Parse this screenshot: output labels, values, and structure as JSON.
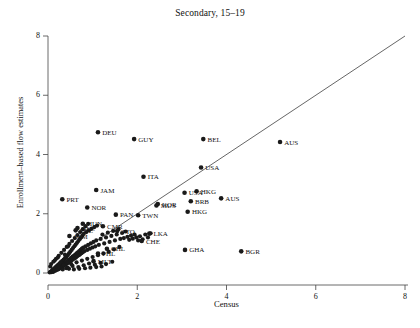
{
  "chart_data": {
    "type": "scatter",
    "title": "Secondary, 15–19",
    "xlabel": "Census",
    "ylabel": "Enrollment–based flow estimates",
    "xlim": [
      0,
      8.3
    ],
    "ylim": [
      0,
      8.3
    ],
    "xticks": [
      "0",
      "2",
      "4",
      "6",
      "8"
    ],
    "xtick_values": [
      0,
      2,
      4,
      6,
      8
    ],
    "yticks": [
      "0",
      "2",
      "4",
      "6",
      "8"
    ],
    "ytick_values": [
      0,
      2,
      4,
      6,
      8
    ],
    "grid": false,
    "legend": null,
    "reference_line": {
      "name": "45-degree identity line",
      "from": [
        0,
        0
      ],
      "to": [
        8,
        8
      ],
      "color": "#555555"
    },
    "marker": {
      "shape": "circle",
      "color": "#1a1a1a",
      "radius": 2.1
    },
    "labeled_points": [
      {
        "label": "DEU",
        "x": 1.12,
        "y": 4.75
      },
      {
        "label": "GUY",
        "x": 1.93,
        "y": 4.52
      },
      {
        "label": "BEL",
        "x": 3.48,
        "y": 4.52
      },
      {
        "label": "AUS",
        "x": 5.2,
        "y": 4.42
      },
      {
        "label": "USA",
        "x": 3.43,
        "y": 3.56
      },
      {
        "label": "ITA",
        "x": 2.14,
        "y": 3.25
      },
      {
        "label": "JAM",
        "x": 1.08,
        "y": 2.8
      },
      {
        "label": "USA",
        "x": 3.06,
        "y": 2.71
      },
      {
        "label": "HKG",
        "x": 3.33,
        "y": 2.76
      },
      {
        "label": "PRT",
        "x": 0.32,
        "y": 2.49
      },
      {
        "label": "AUS",
        "x": 3.88,
        "y": 2.52
      },
      {
        "label": "BRB",
        "x": 3.2,
        "y": 2.42
      },
      {
        "label": "KOR",
        "x": 2.46,
        "y": 2.33
      },
      {
        "label": "MUS",
        "x": 2.43,
        "y": 2.28
      },
      {
        "label": "NOR",
        "x": 0.88,
        "y": 2.21
      },
      {
        "label": "HKG",
        "x": 3.13,
        "y": 2.07
      },
      {
        "label": "PAN",
        "x": 1.52,
        "y": 1.97
      },
      {
        "label": "TWN",
        "x": 2.02,
        "y": 1.95
      },
      {
        "label": "HUN",
        "x": 0.78,
        "y": 1.66
      },
      {
        "label": "CMR",
        "x": 1.23,
        "y": 1.58
      },
      {
        "label": "BEL",
        "x": 0.66,
        "y": 1.52
      },
      {
        "label": "POL",
        "x": 0.62,
        "y": 1.44
      },
      {
        "label": "TTO",
        "x": 1.55,
        "y": 1.42
      },
      {
        "label": "LKA",
        "x": 2.27,
        "y": 1.33
      },
      {
        "label": "JAM",
        "x": 0.48,
        "y": 1.25
      },
      {
        "label": "CHE",
        "x": 2.1,
        "y": 1.08
      },
      {
        "label": "GHA",
        "x": 3.07,
        "y": 0.78
      },
      {
        "label": "BGR",
        "x": 4.33,
        "y": 0.73
      },
      {
        "label": "CHL",
        "x": 1.32,
        "y": 0.82
      },
      {
        "label": "PHL",
        "x": 1.12,
        "y": 0.66
      },
      {
        "label": "MLT",
        "x": 1.02,
        "y": 0.4
      }
    ],
    "unlabeled_cluster_note": "Dense overlapping cluster of country points between x=0 and x=2.5, y=0 to y=2",
    "cluster_points": [
      [
        0.04,
        0.02
      ],
      [
        0.06,
        0.05
      ],
      [
        0.08,
        0.03
      ],
      [
        0.09,
        0.09
      ],
      [
        0.1,
        0.05
      ],
      [
        0.11,
        0.12
      ],
      [
        0.12,
        0.04
      ],
      [
        0.13,
        0.1
      ],
      [
        0.14,
        0.16
      ],
      [
        0.15,
        0.07
      ],
      [
        0.16,
        0.13
      ],
      [
        0.17,
        0.2
      ],
      [
        0.18,
        0.09
      ],
      [
        0.19,
        0.15
      ],
      [
        0.2,
        0.24
      ],
      [
        0.21,
        0.11
      ],
      [
        0.22,
        0.18
      ],
      [
        0.23,
        0.28
      ],
      [
        0.24,
        0.13
      ],
      [
        0.25,
        0.21
      ],
      [
        0.26,
        0.32
      ],
      [
        0.27,
        0.16
      ],
      [
        0.28,
        0.24
      ],
      [
        0.29,
        0.36
      ],
      [
        0.3,
        0.19
      ],
      [
        0.31,
        0.27
      ],
      [
        0.32,
        0.41
      ],
      [
        0.33,
        0.22
      ],
      [
        0.34,
        0.3
      ],
      [
        0.35,
        0.45
      ],
      [
        0.36,
        0.25
      ],
      [
        0.37,
        0.33
      ],
      [
        0.38,
        0.5
      ],
      [
        0.39,
        0.28
      ],
      [
        0.4,
        0.37
      ],
      [
        0.41,
        0.55
      ],
      [
        0.42,
        0.31
      ],
      [
        0.43,
        0.4
      ],
      [
        0.44,
        0.6
      ],
      [
        0.45,
        0.34
      ],
      [
        0.46,
        0.44
      ],
      [
        0.47,
        0.66
      ],
      [
        0.48,
        0.37
      ],
      [
        0.49,
        0.47
      ],
      [
        0.5,
        0.72
      ],
      [
        0.51,
        0.4
      ],
      [
        0.52,
        0.51
      ],
      [
        0.53,
        0.78
      ],
      [
        0.54,
        0.44
      ],
      [
        0.55,
        0.55
      ],
      [
        0.56,
        0.84
      ],
      [
        0.57,
        0.47
      ],
      [
        0.58,
        0.58
      ],
      [
        0.59,
        0.9
      ],
      [
        0.6,
        0.5
      ],
      [
        0.61,
        0.62
      ],
      [
        0.62,
        0.96
      ],
      [
        0.63,
        0.53
      ],
      [
        0.64,
        0.66
      ],
      [
        0.65,
        1.02
      ],
      [
        0.66,
        0.57
      ],
      [
        0.67,
        0.7
      ],
      [
        0.68,
        1.08
      ],
      [
        0.69,
        0.6
      ],
      [
        0.7,
        0.74
      ],
      [
        0.71,
        1.14
      ],
      [
        0.72,
        0.63
      ],
      [
        0.73,
        0.78
      ],
      [
        0.74,
        1.2
      ],
      [
        0.75,
        0.67
      ],
      [
        0.76,
        0.82
      ],
      [
        0.77,
        1.26
      ],
      [
        0.78,
        0.7
      ],
      [
        0.79,
        0.86
      ],
      [
        0.8,
        1.32
      ],
      [
        0.82,
        0.74
      ],
      [
        0.84,
        0.9
      ],
      [
        0.86,
        1.38
      ],
      [
        0.88,
        0.78
      ],
      [
        0.9,
        0.95
      ],
      [
        0.92,
        1.44
      ],
      [
        0.94,
        0.82
      ],
      [
        0.96,
        1.0
      ],
      [
        0.98,
        1.5
      ],
      [
        1.0,
        0.86
      ],
      [
        1.02,
        1.05
      ],
      [
        1.04,
        1.55
      ],
      [
        1.06,
        0.9
      ],
      [
        1.08,
        1.1
      ],
      [
        1.1,
        1.6
      ],
      [
        1.14,
        0.95
      ],
      [
        1.18,
        1.15
      ],
      [
        1.22,
        1.3
      ],
      [
        1.26,
        1.0
      ],
      [
        1.3,
        1.2
      ],
      [
        1.34,
        1.36
      ],
      [
        1.38,
        1.05
      ],
      [
        1.42,
        1.25
      ],
      [
        1.46,
        1.42
      ],
      [
        1.5,
        1.1
      ],
      [
        1.54,
        1.3
      ],
      [
        1.58,
        1.48
      ],
      [
        1.62,
        1.15
      ],
      [
        1.66,
        1.35
      ],
      [
        1.7,
        1.18
      ],
      [
        1.74,
        1.4
      ],
      [
        1.78,
        1.22
      ],
      [
        1.82,
        1.12
      ],
      [
        1.86,
        1.26
      ],
      [
        1.9,
        1.16
      ],
      [
        1.94,
        1.3
      ],
      [
        1.98,
        1.2
      ],
      [
        2.02,
        1.1
      ],
      [
        2.06,
        1.24
      ],
      [
        2.12,
        1.14
      ],
      [
        2.18,
        1.3
      ],
      [
        2.24,
        1.2
      ],
      [
        2.3,
        1.34
      ],
      [
        0.05,
        0.22
      ],
      [
        0.07,
        0.3
      ],
      [
        0.12,
        0.38
      ],
      [
        0.18,
        0.48
      ],
      [
        0.24,
        0.58
      ],
      [
        0.3,
        0.68
      ],
      [
        0.36,
        0.78
      ],
      [
        0.42,
        0.88
      ],
      [
        0.48,
        0.98
      ],
      [
        0.54,
        1.08
      ],
      [
        0.6,
        1.18
      ],
      [
        0.66,
        1.28
      ],
      [
        0.72,
        1.38
      ],
      [
        0.78,
        1.48
      ],
      [
        0.84,
        1.58
      ],
      [
        0.9,
        1.66
      ],
      [
        0.45,
        0.9
      ],
      [
        0.38,
        0.62
      ],
      [
        0.52,
        0.3
      ],
      [
        0.64,
        0.36
      ],
      [
        0.76,
        0.42
      ],
      [
        0.88,
        0.48
      ],
      [
        1.0,
        0.54
      ],
      [
        1.12,
        0.6
      ],
      [
        1.24,
        0.66
      ],
      [
        1.36,
        0.72
      ],
      [
        1.48,
        0.8
      ],
      [
        1.6,
        0.88
      ],
      [
        0.33,
        0.12
      ],
      [
        0.44,
        0.18
      ],
      [
        0.55,
        0.24
      ],
      [
        0.68,
        0.2
      ],
      [
        0.8,
        0.26
      ],
      [
        0.92,
        0.32
      ],
      [
        1.05,
        0.28
      ],
      [
        1.18,
        0.34
      ],
      [
        1.3,
        0.3
      ],
      [
        1.44,
        0.38
      ],
      [
        0.15,
        0.42
      ],
      [
        0.22,
        0.52
      ],
      [
        0.28,
        0.36
      ],
      [
        0.35,
        0.26
      ],
      [
        0.41,
        0.16
      ],
      [
        0.47,
        0.14
      ],
      [
        0.58,
        0.12
      ],
      [
        0.7,
        0.14
      ],
      [
        0.83,
        0.16
      ],
      [
        0.95,
        0.18
      ],
      [
        1.08,
        0.2
      ],
      [
        1.2,
        0.22
      ]
    ]
  },
  "caption": {
    "text": ""
  }
}
